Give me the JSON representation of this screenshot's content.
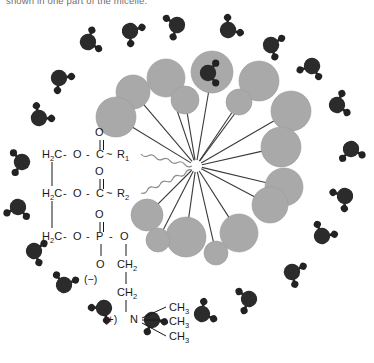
{
  "figure": {
    "caption_top": "shown in one part of the micelle.",
    "molecule_name": "phosphatidylcholine",
    "colors": {
      "head_group_fill": "#a9a9a9",
      "head_group_stroke": "#9a9a9a",
      "water_oxygen": "#2b2b2b",
      "water_hydrogen": "#222222",
      "tail_line": "#3a3a3a",
      "wavy_tail": "#8d8d8d",
      "text": "#181818",
      "background": "#ffffff"
    }
  },
  "structure": {
    "backbone": [
      {
        "id": "c1",
        "left_label": "H",
        "left_sub": "2",
        "left_label_2": "C",
        "bond_1": "-",
        "atom_o": "O",
        "bond_2": "-",
        "atom_c": "C",
        "carbonyl_o": "O",
        "carbonyl_bond": "||",
        "tilde": "~",
        "r_label": "R",
        "r_sub": "1"
      },
      {
        "id": "c2",
        "left_label": "H",
        "left_sub": "2",
        "left_label_2": "C",
        "bond_1": "-",
        "atom_o": "O",
        "bond_2": "-",
        "atom_c": "C",
        "carbonyl_o": "O",
        "carbonyl_bond": "||",
        "tilde": "~",
        "r_label": "R",
        "r_sub": "2"
      },
      {
        "id": "c3",
        "left_label": "H",
        "left_sub": "2",
        "left_label_2": "C",
        "bond_1": "-",
        "atom_o": "O",
        "bond_2": "-",
        "atom_p": "P",
        "phosphoryl_o": "O",
        "phosphoryl_bond": "||",
        "bond_3": "-",
        "ester_o": "O"
      }
    ],
    "phosphate": {
      "lower_o": "O",
      "negative_charge": "(−)"
    },
    "choline": {
      "ch2_upper": "CH",
      "ch2_upper_sub": "2",
      "ch2_lower": "CH",
      "ch2_lower_sub": "2",
      "positive_charge": "(+)",
      "nitrogen": "N",
      "methyls": [
        {
          "label": "CH",
          "sub": "3"
        },
        {
          "label": "CH",
          "sub": "3"
        },
        {
          "label": "CH",
          "sub": "3"
        }
      ]
    }
  },
  "micelle": {
    "center": {
      "x": 196,
      "y": 166
    },
    "head_groups": [
      {
        "cx": 166,
        "cy": 78,
        "r": 19
      },
      {
        "cx": 212,
        "cy": 72,
        "r": 21
      },
      {
        "cx": 259,
        "cy": 81,
        "r": 20
      },
      {
        "cx": 133,
        "cy": 92,
        "r": 17
      },
      {
        "cx": 185,
        "cy": 100,
        "r": 14
      },
      {
        "cx": 239,
        "cy": 102,
        "r": 13
      },
      {
        "cx": 291,
        "cy": 111,
        "r": 20
      },
      {
        "cx": 116,
        "cy": 117,
        "r": 20
      },
      {
        "cx": 281,
        "cy": 147,
        "r": 20
      },
      {
        "cx": 284,
        "cy": 187,
        "r": 19
      },
      {
        "cx": 147,
        "cy": 215,
        "r": 16
      },
      {
        "cx": 186,
        "cy": 237,
        "r": 20
      },
      {
        "cx": 239,
        "cy": 233,
        "r": 19
      },
      {
        "cx": 270,
        "cy": 205,
        "r": 18
      },
      {
        "cx": 158,
        "cy": 240,
        "r": 12
      },
      {
        "cx": 216,
        "cy": 253,
        "r": 12
      }
    ],
    "wavy_tails": [
      {
        "x1": 141,
        "y1": 154,
        "x2": 192,
        "y2": 166
      },
      {
        "x1": 141,
        "y1": 193,
        "x2": 192,
        "y2": 170
      }
    ],
    "head_group_count": 16
  },
  "water_molecules": [
    {
      "cx": 88,
      "cy": 42,
      "rot": -20
    },
    {
      "cx": 130,
      "cy": 31,
      "rot": 35
    },
    {
      "cx": 177,
      "cy": 25,
      "rot": 160
    },
    {
      "cx": 228,
      "cy": 30,
      "rot": -40
    },
    {
      "cx": 271,
      "cy": 45,
      "rot": 20
    },
    {
      "cx": 312,
      "cy": 66,
      "rot": 110
    },
    {
      "cx": 337,
      "cy": 105,
      "rot": -15
    },
    {
      "cx": 351,
      "cy": 149,
      "rot": 80
    },
    {
      "cx": 345,
      "cy": 196,
      "rot": 145
    },
    {
      "cx": 322,
      "cy": 236,
      "rot": -60
    },
    {
      "cx": 292,
      "cy": 272,
      "rot": 25
    },
    {
      "cx": 249,
      "cy": 299,
      "rot": 165
    },
    {
      "cx": 202,
      "cy": 314,
      "rot": -30
    },
    {
      "cx": 152,
      "cy": 320,
      "rot": 60
    },
    {
      "cx": 104,
      "cy": 308,
      "rot": 130
    },
    {
      "cx": 64,
      "cy": 285,
      "rot": -75
    },
    {
      "cx": 34,
      "cy": 251,
      "rot": 15
    },
    {
      "cx": 18,
      "cy": 207,
      "rot": 100
    },
    {
      "cx": 22,
      "cy": 162,
      "rot": 175
    },
    {
      "cx": 39,
      "cy": 118,
      "rot": -50
    },
    {
      "cx": 59,
      "cy": 78,
      "rot": 45
    },
    {
      "cx": 208,
      "cy": 73,
      "rot": 0
    }
  ]
}
